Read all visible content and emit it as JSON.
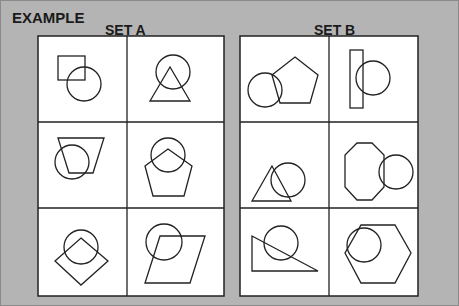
{
  "title": "EXAMPLE",
  "sets": [
    {
      "label": "SET A",
      "cells": [
        {
          "shape": "square",
          "overlap": "circle"
        },
        {
          "shape": "triangle",
          "overlap": "circle"
        },
        {
          "shape": "trapezoid",
          "overlap": "circle"
        },
        {
          "shape": "pentagon",
          "overlap": "circle"
        },
        {
          "shape": "diamond",
          "overlap": "circle"
        },
        {
          "shape": "parallelogram",
          "overlap": "circle"
        }
      ]
    },
    {
      "label": "SET B",
      "cells": [
        {
          "shape": "pentagon",
          "overlap": "circle"
        },
        {
          "shape": "rectangle",
          "overlap": "circle"
        },
        {
          "shape": "triangle",
          "overlap": "circle"
        },
        {
          "shape": "octagon",
          "overlap": "circle"
        },
        {
          "shape": "right-triangle",
          "overlap": "circle"
        },
        {
          "shape": "hexagon",
          "overlap": "circle"
        }
      ]
    }
  ],
  "colors": {
    "background": "#b4b4b4",
    "panel": "#ffffff",
    "stroke": "#222222"
  }
}
